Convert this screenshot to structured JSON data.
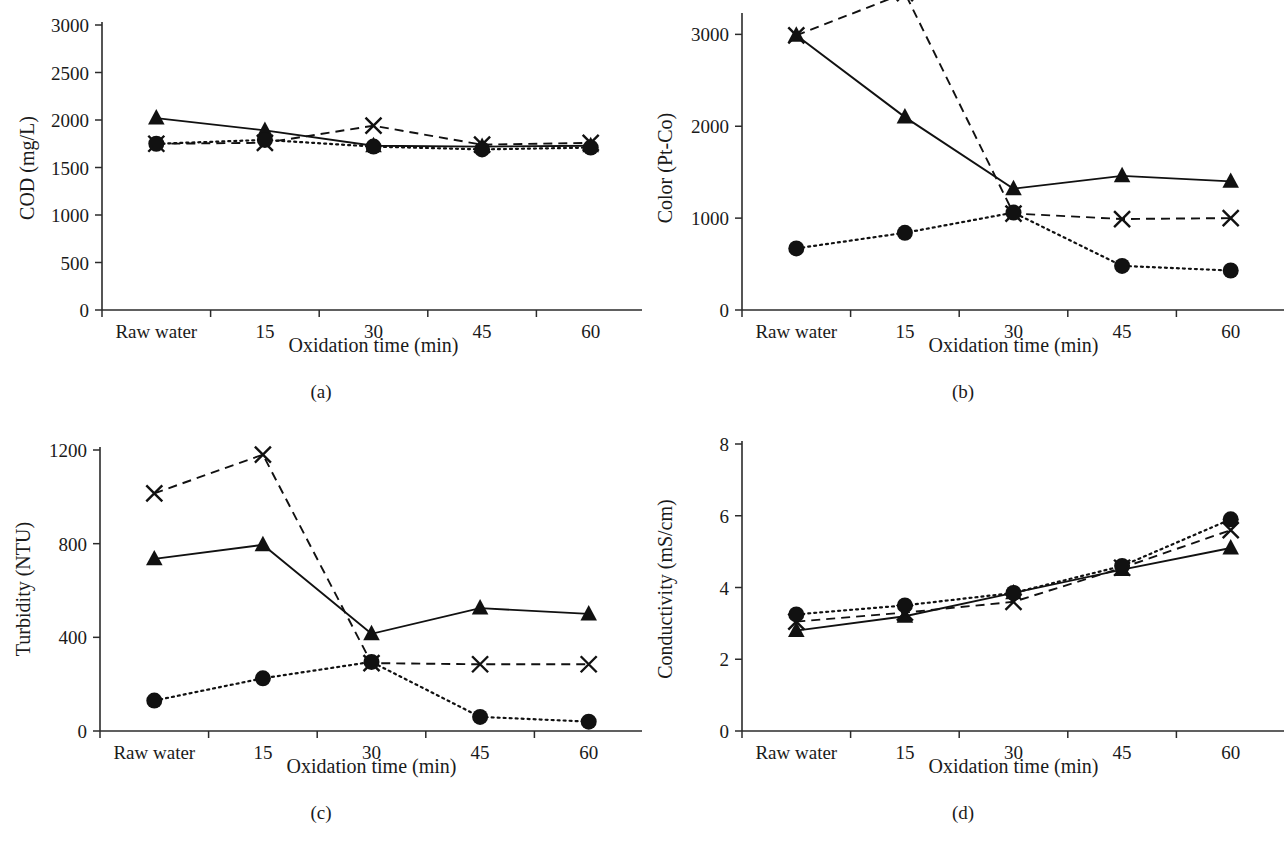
{
  "figure": {
    "background_color": "#ffffff",
    "ink_color": "#111111",
    "shared_xlabel": "Oxidation time (min)",
    "categories": [
      "Raw water",
      "15",
      "30",
      "45",
      "60"
    ]
  },
  "series_styles": [
    {
      "key": "triangle",
      "marker": "triangle",
      "line": "solid"
    },
    {
      "key": "x",
      "marker": "x",
      "line": "dashed"
    },
    {
      "key": "circle",
      "marker": "circle",
      "line": "dotted"
    }
  ],
  "panels": [
    {
      "caption": "(a)",
      "ylabel": "COD (mg/L)",
      "xlabel": "Oxidation time (min)",
      "yticks": [
        "0",
        "500",
        "1000",
        "1500",
        "2000",
        "2500",
        "3000"
      ],
      "xticklabels": [
        "Raw water",
        "15",
        "30",
        "45",
        "60"
      ]
    },
    {
      "caption": "(b)",
      "ylabel": "Color (Pt-Co)",
      "xlabel": "Oxidation time (min)",
      "yticks": [
        "0",
        "1000",
        "2000",
        "3000"
      ],
      "xticklabels": [
        "Raw water",
        "15",
        "30",
        "45",
        "60"
      ]
    },
    {
      "caption": "(c)",
      "ylabel": "Turbidity (NTU)",
      "xlabel": "Oxidation time (min)",
      "yticks": [
        "0",
        "400",
        "800",
        "1200"
      ],
      "xticklabels": [
        "Raw water",
        "15",
        "30",
        "45",
        "60"
      ]
    },
    {
      "caption": "(d)",
      "ylabel": "Conductivity (mS/cm)",
      "xlabel": "Oxidation time (min)",
      "yticks": [
        "0",
        "2",
        "4",
        "6",
        "8"
      ],
      "xticklabels": [
        "Raw water",
        "15",
        "30",
        "45",
        "60"
      ]
    }
  ],
  "chart_data": [
    {
      "type": "line",
      "panel": "(a)",
      "title": "",
      "xlabel": "Oxidation time (min)",
      "ylabel": "COD (mg/L)",
      "categories": [
        "Raw water",
        "15",
        "30",
        "45",
        "60"
      ],
      "ylim": [
        0,
        3000
      ],
      "yticks": [
        0,
        500,
        1000,
        1500,
        2000,
        2500,
        3000
      ],
      "grid": false,
      "legend": "none",
      "series": [
        {
          "name": "triangle",
          "marker": "triangle",
          "line": "solid",
          "values": [
            2020,
            1890,
            1730,
            1720,
            1730
          ]
        },
        {
          "name": "x",
          "marker": "x",
          "line": "dashed",
          "values": [
            1750,
            1760,
            1940,
            1740,
            1760
          ]
        },
        {
          "name": "circle",
          "marker": "circle",
          "line": "dotted",
          "values": [
            1750,
            1790,
            1720,
            1690,
            1710
          ]
        }
      ]
    },
    {
      "type": "line",
      "panel": "(b)",
      "title": "",
      "xlabel": "Oxidation time (min)",
      "ylabel": "Color (Pt-Co)",
      "categories": [
        "Raw water",
        "15",
        "30",
        "45",
        "60"
      ],
      "ylim": [
        0,
        3200
      ],
      "yticks": [
        0,
        1000,
        2000,
        3000
      ],
      "grid": false,
      "legend": "none",
      "series": [
        {
          "name": "triangle",
          "marker": "triangle",
          "line": "solid",
          "values": [
            2990,
            2100,
            1320,
            1460,
            1400
          ]
        },
        {
          "name": "x",
          "marker": "x",
          "line": "dashed",
          "values": [
            2990,
            3450,
            1050,
            990,
            1000
          ]
        },
        {
          "name": "circle",
          "marker": "circle",
          "line": "dotted",
          "values": [
            670,
            840,
            1060,
            480,
            430
          ]
        }
      ]
    },
    {
      "type": "line",
      "panel": "(c)",
      "title": "",
      "xlabel": "Oxidation time (min)",
      "ylabel": "Turbidity (NTU)",
      "categories": [
        "Raw water",
        "15",
        "30",
        "45",
        "60"
      ],
      "ylim": [
        0,
        1200
      ],
      "yticks": [
        0,
        400,
        800,
        1200
      ],
      "grid": false,
      "legend": "none",
      "series": [
        {
          "name": "triangle",
          "marker": "triangle",
          "line": "solid",
          "values": [
            735,
            795,
            415,
            525,
            500
          ]
        },
        {
          "name": "x",
          "marker": "x",
          "line": "dashed",
          "values": [
            1015,
            1180,
            290,
            285,
            285
          ]
        },
        {
          "name": "circle",
          "marker": "circle",
          "line": "dotted",
          "values": [
            130,
            225,
            295,
            60,
            40
          ]
        }
      ]
    },
    {
      "type": "line",
      "panel": "(d)",
      "title": "",
      "xlabel": "Oxidation time (min)",
      "ylabel": "Conductivity (mS/cm)",
      "categories": [
        "Raw water",
        "15",
        "30",
        "45",
        "60"
      ],
      "ylim": [
        0,
        8
      ],
      "yticks": [
        0,
        2,
        4,
        6,
        8
      ],
      "grid": false,
      "legend": "none",
      "series": [
        {
          "name": "triangle",
          "marker": "triangle",
          "line": "solid",
          "values": [
            2.8,
            3.2,
            3.85,
            4.5,
            5.1
          ]
        },
        {
          "name": "x",
          "marker": "x",
          "line": "dashed",
          "values": [
            3.05,
            3.3,
            3.6,
            4.55,
            5.6
          ]
        },
        {
          "name": "circle",
          "marker": "circle",
          "line": "dotted",
          "values": [
            3.25,
            3.5,
            3.85,
            4.6,
            5.9
          ]
        }
      ]
    }
  ]
}
